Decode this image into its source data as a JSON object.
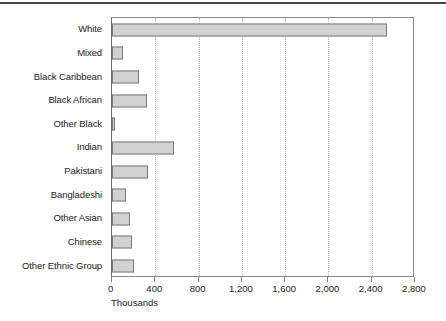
{
  "chart_data": {
    "type": "bar",
    "orientation": "horizontal",
    "title": "",
    "xlabel": "Thousands",
    "ylabel": "",
    "xlim": [
      0,
      2800
    ],
    "xticks": [
      0,
      400,
      800,
      1200,
      1600,
      2000,
      2400,
      2800
    ],
    "xtick_labels": [
      "0",
      "400",
      "800",
      "1,200",
      "1,600",
      "2,000",
      "2,400",
      "2,800"
    ],
    "grid": "vertical-dotted",
    "legend": "none",
    "categories": [
      "White",
      "Mixed",
      "Black Caribbean",
      "Black African",
      "Other Black",
      "Indian",
      "Pakistani",
      "Bangladeshi",
      "Other Asian",
      "Chinese",
      "Other Ethnic Group"
    ],
    "values": [
      2540,
      100,
      250,
      325,
      30,
      575,
      335,
      130,
      165,
      185,
      205
    ],
    "bar_fill": "#d2d2d2",
    "bar_edge": "#7b7b7b"
  },
  "colors": {
    "bar_fill": "#d2d2d2",
    "bar_edge": "#7b7b7b",
    "gridline": "#b9b9b9",
    "frame": "#8a8a8a",
    "text": "#1b1b1b",
    "top_rule": "#4a4a4a",
    "background": "#ffffff"
  }
}
